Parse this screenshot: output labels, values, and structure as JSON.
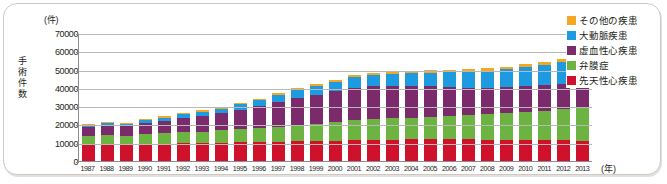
{
  "chart_data": {
    "type": "bar",
    "stacked": true,
    "title": "",
    "subtitle": "",
    "xlabel": "(年)",
    "ylabel": "手術件数",
    "yunit": "(件)",
    "ylim": [
      0,
      70000
    ],
    "ytick_step": 10000,
    "yticks": [
      "70000",
      "60000",
      "50000",
      "40000",
      "30000",
      "20000",
      "10000",
      "0"
    ],
    "ytick_values": [
      70000,
      60000,
      50000,
      40000,
      30000,
      20000,
      10000,
      0
    ],
    "grid": true,
    "legend_position": "top-right",
    "categories": [
      "1987",
      "1988",
      "1989",
      "1990",
      "1991",
      "1992",
      "1993",
      "1994",
      "1995",
      "1996",
      "1997",
      "1998",
      "1999",
      "2000",
      "2001",
      "2002",
      "2003",
      "2004",
      "2005",
      "2006",
      "2007",
      "2008",
      "2009",
      "2010",
      "2011",
      "2012",
      "2013"
    ],
    "series": [
      {
        "name": "先天性心疾患",
        "color": "#D0112B",
        "values": [
          8800,
          9000,
          8700,
          9300,
          9500,
          9700,
          9800,
          10000,
          10200,
          10300,
          10600,
          10800,
          11000,
          11200,
          11500,
          11600,
          11700,
          11800,
          11900,
          12000,
          11800,
          11700,
          11600,
          11500,
          11400,
          11300,
          11200
        ]
      },
      {
        "name": "弁膜症",
        "color": "#6CB342",
        "values": [
          4800,
          5000,
          4900,
          5300,
          5600,
          6000,
          6300,
          6700,
          7200,
          7600,
          8200,
          8800,
          9400,
          10000,
          10800,
          11200,
          11600,
          11900,
          12300,
          12600,
          13200,
          13800,
          14500,
          15300,
          16200,
          17000,
          17800
        ]
      },
      {
        "name": "虚血性心疾患",
        "color": "#7B2B6B",
        "values": [
          5200,
          5600,
          5400,
          6200,
          7000,
          7900,
          8600,
          9400,
          10600,
          12000,
          13600,
          14800,
          15800,
          17000,
          17800,
          18000,
          17800,
          17200,
          16600,
          16000,
          15200,
          14600,
          14200,
          14000,
          13800,
          14000,
          14000
        ]
      },
      {
        "name": "大動脈疾患",
        "color": "#1E9BE0",
        "values": [
          800,
          1100,
          1100,
          1400,
          1700,
          2000,
          2300,
          2600,
          3000,
          3400,
          3900,
          4300,
          4700,
          5200,
          5700,
          6200,
          6700,
          7100,
          7600,
          8000,
          8600,
          9200,
          9800,
          10400,
          11000,
          11800,
          13000
        ]
      },
      {
        "name": "その他の疾患",
        "color": "#F5A623",
        "values": [
          500,
          500,
          500,
          600,
          600,
          700,
          700,
          800,
          800,
          900,
          900,
          1000,
          1000,
          1100,
          1100,
          1200,
          1200,
          1300,
          1300,
          1400,
          1400,
          1500,
          1500,
          1600,
          1600,
          1700,
          1800
        ]
      }
    ],
    "totals": [
      20100,
      21200,
      20600,
      22800,
      24400,
      26300,
      27700,
      29500,
      31800,
      34200,
      37200,
      39700,
      41900,
      44500,
      46900,
      48200,
      49000,
      49300,
      49700,
      50000,
      50200,
      50800,
      51600,
      52800,
      54000,
      55800,
      57800
    ],
    "legend_entries": [
      {
        "label": "その他の疾患",
        "color": "#F5A623"
      },
      {
        "label": "大動脈疾患",
        "color": "#1E9BE0"
      },
      {
        "label": "虚血性心疾患",
        "color": "#7B2B6B"
      },
      {
        "label": "弁膜症",
        "color": "#6CB342"
      },
      {
        "label": "先天性心疾患",
        "color": "#D0112B"
      }
    ]
  }
}
